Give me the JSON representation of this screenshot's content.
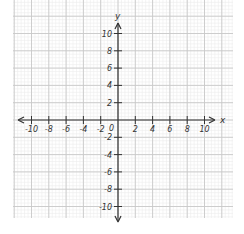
{
  "diagram": {
    "type": "coordinate-plane",
    "x_axis": {
      "label": "x",
      "ticks": [
        -10,
        -8,
        -6,
        -4,
        -2,
        2,
        4,
        6,
        8,
        10
      ],
      "tick_labels": [
        "-10",
        "-8",
        "-6",
        "-4",
        "-2",
        "2",
        "4",
        "6",
        "8",
        "10"
      ],
      "range": [
        -10,
        10
      ],
      "arrows": "both"
    },
    "y_axis": {
      "label": "y",
      "ticks": [
        10,
        8,
        6,
        4,
        2,
        -2,
        -4,
        -6,
        -8,
        -10
      ],
      "tick_labels": [
        "10",
        "8",
        "6",
        "4",
        "2",
        "-2",
        "-4",
        "-6",
        "-8",
        "-10"
      ],
      "range": [
        -10,
        10
      ],
      "arrows": "both"
    },
    "origin_label": "0",
    "grid": {
      "units_per_major": 2,
      "minor_per_major": 5,
      "major_color": "#c8c8c8",
      "minor_color": "#ececec"
    },
    "colors": {
      "axis": "#333333",
      "background": "#ffffff"
    }
  }
}
